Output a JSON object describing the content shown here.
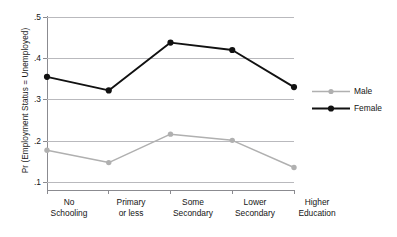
{
  "chart_data": {
    "type": "line",
    "title": "",
    "xlabel": "",
    "ylabel": "Pr (Employment Status = Unemployed)",
    "categories": [
      "No Schooling",
      "Primary or less",
      "Some Secondary",
      "Lower Secondary",
      "Higher Education"
    ],
    "category_lines": [
      [
        "No",
        "Schooling"
      ],
      [
        "Primary",
        "or less"
      ],
      [
        "Some",
        "Secondary"
      ],
      [
        "Lower",
        "Secondary"
      ],
      [
        "Higher",
        "Education"
      ]
    ],
    "series": [
      {
        "name": "Male",
        "color": "#b0b0b0",
        "values": [
          0.177,
          0.147,
          0.216,
          0.201,
          0.135
        ]
      },
      {
        "name": "Female",
        "color": "#111111",
        "values": [
          0.355,
          0.322,
          0.438,
          0.42,
          0.33
        ]
      }
    ],
    "ylim": [
      0.1,
      0.5
    ],
    "ytick_values": [
      0.5,
      0.4,
      0.3,
      0.2,
      0.1
    ],
    "ytick_labels": [
      ".5",
      ".4",
      ".3",
      ".2",
      ".1"
    ],
    "grid": true,
    "grid_color": "#b9b9bd",
    "legend_position": "right",
    "legend": [
      {
        "label": "Male",
        "color": "#b0b0b0"
      },
      {
        "label": "Female",
        "color": "#111111"
      }
    ]
  }
}
